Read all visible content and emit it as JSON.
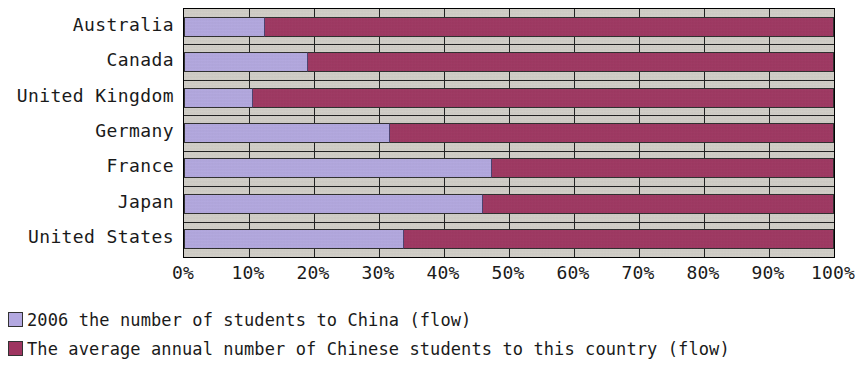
{
  "chart_data": {
    "type": "bar",
    "orientation": "horizontal",
    "stacked": true,
    "normalized": true,
    "title": "",
    "xlabel": "",
    "ylabel": "",
    "xlim": [
      0,
      100
    ],
    "grid": true,
    "legend_position": "bottom-left",
    "categories": [
      "Australia",
      "Canada",
      "United Kingdom",
      "Germany",
      "France",
      "Japan",
      "United States"
    ],
    "xtick_labels": [
      "0%",
      "10%",
      "20%",
      "30%",
      "40%",
      "50%",
      "60%",
      "70%",
      "80%",
      "90%",
      "100%"
    ],
    "xtick_values": [
      0,
      10,
      20,
      30,
      40,
      50,
      60,
      70,
      80,
      90,
      100
    ],
    "series": [
      {
        "name": "2006 the number of students to China (flow)",
        "color": "#b3a8e0",
        "values": [
          12.5,
          19.0,
          10.6,
          31.7,
          47.4,
          46.0,
          33.8
        ]
      },
      {
        "name": "The average annual number of Chinese students to this country (flow)",
        "color": "#9e3560",
        "values": [
          87.5,
          81.0,
          89.4,
          68.3,
          52.6,
          54.0,
          66.2
        ]
      }
    ]
  },
  "legend": {
    "items": [
      {
        "label": "2006 the number of students to China (flow)",
        "color": "#b3a8e0"
      },
      {
        "label": "The average annual number of Chinese students to this country (flow)",
        "color": "#9e3560"
      }
    ]
  },
  "plot_style": {
    "background": "#d2cfc8",
    "axis_line": "#000000",
    "gridline": "#1c1c1c"
  }
}
